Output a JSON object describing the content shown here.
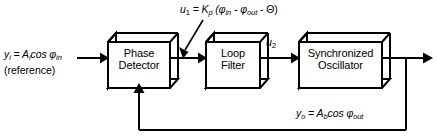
{
  "diagram": {
    "background_color": "#ffffff",
    "line_color": "#000000",
    "blocks": [
      {
        "id": "phase-detector",
        "line1": "Phase",
        "line2": "Detector"
      },
      {
        "id": "loop-filter",
        "line1": "Loop",
        "line2": "Filter"
      },
      {
        "id": "synchronized-oscillator",
        "line1": "Synchronized",
        "line2": "Oscillator"
      }
    ],
    "labels": {
      "input_signal": "y",
      "input_signal_sub": "i",
      "input_eq_rest": " = A",
      "input_amp_sub": "i",
      "input_cos": "cos φ",
      "input_phase_sub": "in",
      "input_reference": "(reference)",
      "u1_name": "u",
      "u1_sub": "1",
      "u1_eq": " = K",
      "u1_gain_sub": "p",
      "u1_expr_open": " (φ",
      "u1_phi_in_sub": "in",
      "u1_minus1": " - φ",
      "u1_phi_out_sub": "out",
      "u1_minus2": " - Θ)",
      "u2_name": "u",
      "u2_sub": "2",
      "out_signal": "y",
      "out_signal_sub": "o",
      "out_eq_rest": " = A",
      "out_amp_sub": "b",
      "out_cos": "cos φ",
      "out_phase_sub": "out"
    }
  }
}
